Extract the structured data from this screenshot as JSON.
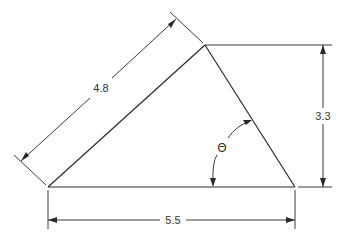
{
  "diagram": {
    "type": "right-angle-triangle-dimension-drawing",
    "dimensions": {
      "hypotenuse_left": "4.8",
      "height": "3.3",
      "base": "5.5"
    },
    "angle_label": "Θ",
    "colors": {
      "line": "#2a2a2a",
      "text": "#333333",
      "background": "#ffffff"
    }
  }
}
